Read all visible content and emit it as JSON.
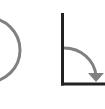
{
  "diagram": {
    "colors": {
      "stroke_gray": "#808080",
      "stroke_dark": "#222222"
    },
    "shapes": [
      {
        "type": "circle-outline",
        "label": ""
      },
      {
        "type": "right-angle-axes",
        "label": ""
      },
      {
        "type": "curved-arrow",
        "label": ""
      }
    ]
  }
}
